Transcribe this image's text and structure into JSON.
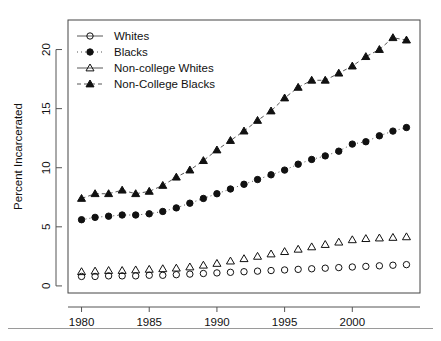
{
  "chart_data": {
    "type": "scatter",
    "title": "",
    "xlabel": "",
    "ylabel": "Percent Incarcerated",
    "xlim": [
      1979,
      2005
    ],
    "ylim": [
      -0.6,
      22.5
    ],
    "xticks": [
      1980,
      1985,
      1990,
      1995,
      2000
    ],
    "yticks": [
      0,
      5,
      10,
      15,
      20
    ],
    "grid": false,
    "legend_position": "top-left",
    "x": [
      1980,
      1981,
      1982,
      1983,
      1984,
      1985,
      1986,
      1987,
      1988,
      1989,
      1990,
      1991,
      1992,
      1993,
      1994,
      1995,
      1996,
      1997,
      1998,
      1999,
      2000,
      2001,
      2002,
      2003,
      2004
    ],
    "series": [
      {
        "name": "Whites",
        "marker": "open-circle",
        "line": "solid",
        "values": [
          0.8,
          0.8,
          0.85,
          0.85,
          0.85,
          0.9,
          0.9,
          0.95,
          1.0,
          1.05,
          1.1,
          1.15,
          1.2,
          1.25,
          1.3,
          1.35,
          1.4,
          1.45,
          1.5,
          1.55,
          1.6,
          1.65,
          1.7,
          1.75,
          1.8
        ]
      },
      {
        "name": "Blacks",
        "marker": "filled-circle",
        "line": "dotted",
        "values": [
          5.6,
          5.8,
          5.9,
          6.0,
          6.0,
          6.1,
          6.3,
          6.6,
          7.0,
          7.4,
          7.8,
          8.2,
          8.6,
          9.0,
          9.4,
          9.8,
          10.3,
          10.7,
          11.0,
          11.4,
          12.0,
          12.2,
          12.7,
          13.1,
          13.4
        ]
      },
      {
        "name": "Non-college Whites",
        "marker": "open-triangle",
        "line": "solid",
        "values": [
          1.2,
          1.25,
          1.3,
          1.3,
          1.35,
          1.4,
          1.45,
          1.5,
          1.6,
          1.75,
          1.9,
          2.1,
          2.3,
          2.5,
          2.7,
          2.9,
          3.1,
          3.3,
          3.5,
          3.7,
          3.9,
          4.0,
          4.05,
          4.1,
          4.15
        ]
      },
      {
        "name": "Non-College Blacks",
        "marker": "filled-triangle",
        "line": "dashed",
        "values": [
          7.4,
          7.8,
          7.8,
          8.1,
          7.8,
          8.0,
          8.5,
          9.2,
          9.8,
          10.6,
          11.5,
          12.3,
          13.1,
          14.0,
          14.8,
          15.9,
          16.8,
          17.4,
          17.4,
          18.0,
          18.6,
          19.4,
          20.0,
          21.0,
          20.8
        ]
      }
    ]
  }
}
